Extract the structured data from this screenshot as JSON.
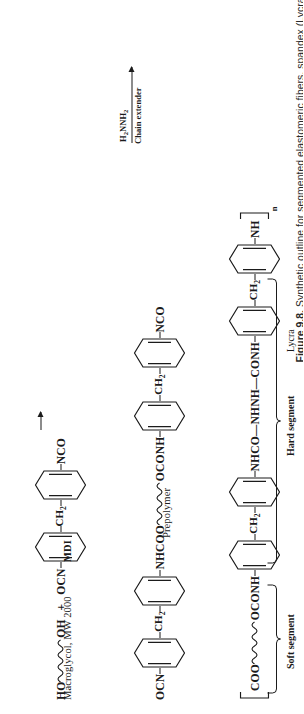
{
  "figure": {
    "caption_label": "Figure 9.8.",
    "caption_text": "Synthetic outline for segmented elastomeric fibers, spandex (Lycra)."
  },
  "reactions": [
    {
      "id": "step1",
      "name": "macroglycol-plus-mdi",
      "reactant_left": {
        "start_group": "HO",
        "end_group": "OH",
        "label": "Macroglycol, MW 2000"
      },
      "plus_sign": "+",
      "reactant_right": {
        "start_group": "OCN",
        "bridge": "CH",
        "bridge_sub": "2",
        "end_group": "NCO",
        "label": "MDI"
      }
    },
    {
      "id": "step2",
      "name": "prepolymer",
      "start_group": "OCN",
      "bridge": "CH",
      "bridge_sub": "2",
      "link_left": "NHCOO",
      "link_right": "OCONH",
      "end_group": "NCO",
      "label": "Prepolymer",
      "arrow": {
        "above": "H",
        "above_sub1": "2",
        "above_mid": "NNH",
        "above_sub2": "2",
        "below": "Chain extender"
      }
    },
    {
      "id": "step3",
      "name": "lycra-polymer",
      "bracket_open": "⌈",
      "start_group": "COO",
      "link_left": "OCONH",
      "bridge": "CH",
      "bridge_sub": "2",
      "urea_link": "NHCO—NHNH—CONH",
      "end_group": "NH",
      "bracket_close": "⌉",
      "repeat_index": "n"
    }
  ],
  "segments": {
    "soft": "Soft segment",
    "hard": "Hard segment",
    "product": "Lycra"
  }
}
